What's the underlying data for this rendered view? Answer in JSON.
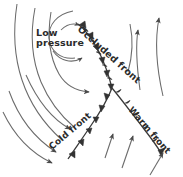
{
  "diagram": {
    "type": "weather-front-diagram",
    "background_color": "#ffffff",
    "line_color": "#555555",
    "symbol_color": "#333333",
    "text_color": "#2b2b2b"
  },
  "labels": {
    "low_pressure_line1": "Low",
    "low_pressure_line2": "pressure",
    "occluded_front": "Occluded front",
    "cold_front": "Cold front",
    "warm_front": "Warm front"
  },
  "fronts": [
    {
      "name": "occluded-front",
      "label": "Occluded front",
      "symbols": "alternating-triangles-and-semicircles",
      "symbol_count": 11,
      "side": "east"
    },
    {
      "name": "cold-front",
      "label": "Cold front",
      "symbols": "triangles",
      "symbol_count": 6,
      "side": "west"
    },
    {
      "name": "warm-front",
      "label": "Warm front",
      "symbols": "semicircles",
      "symbol_count": 5,
      "side": "southeast"
    }
  ],
  "airflow": {
    "streamline_count": 9,
    "spiral_direction": "counterclockwise",
    "warm_sector_arrows": 3
  }
}
